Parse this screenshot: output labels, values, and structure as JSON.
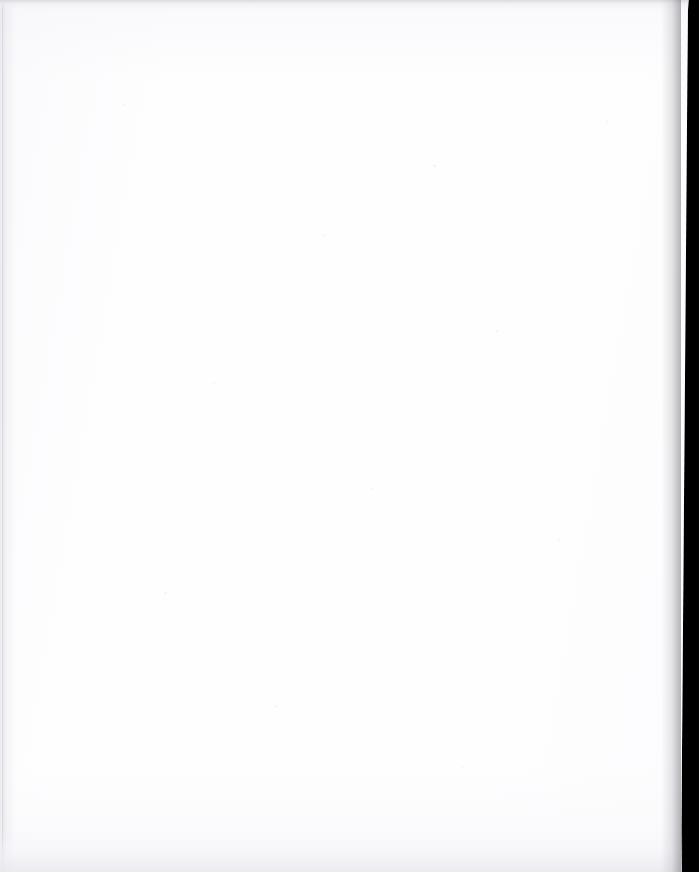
{
  "document": {
    "type": "scanned-page",
    "content_text": "",
    "has_visible_text": false,
    "has_figures": false,
    "description": "Blank scanned page"
  },
  "artifacts": {
    "left_edge_rule": "",
    "top_edge_band": "",
    "bottom_edge_band": "",
    "right_scanner_backing": "",
    "scan_noise": ""
  },
  "colors": {
    "paper": "#fefeff",
    "paper_shade": "#f7f7fa",
    "edge_gray": "#d8d8de",
    "scanner_backing": "#000000",
    "canvas": "#ffffff"
  }
}
